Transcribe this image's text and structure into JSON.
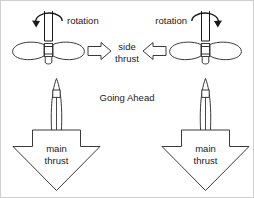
{
  "diagram": {
    "center_caption": "Going Ahead",
    "colors": {
      "ink": "#1a1a1a",
      "outline": "#3a3a3a",
      "background": "#ffffff",
      "border": "#cfcfcf"
    },
    "units": [
      {
        "id": "left",
        "handedness": "right-handed",
        "rotation_label": "rotation",
        "rotation_direction": "counterclockwise",
        "side_thrust_label_line1": "side",
        "side_thrust_label_line2": "thrust",
        "side_thrust_direction": "right",
        "main_thrust_label_line1": "main",
        "main_thrust_label_line2": "thrust",
        "main_thrust_direction": "down"
      },
      {
        "id": "right",
        "handedness": "left-handed",
        "rotation_label": "rotation",
        "rotation_direction": "clockwise",
        "side_thrust_label_line1": "side",
        "side_thrust_label_line2": "thrust",
        "side_thrust_direction": "left",
        "main_thrust_label_line1": "main",
        "main_thrust_label_line2": "thrust",
        "main_thrust_direction": "down"
      }
    ],
    "shared": {
      "side_thrust_label_line1": "side",
      "side_thrust_label_line2": "thrust"
    }
  }
}
